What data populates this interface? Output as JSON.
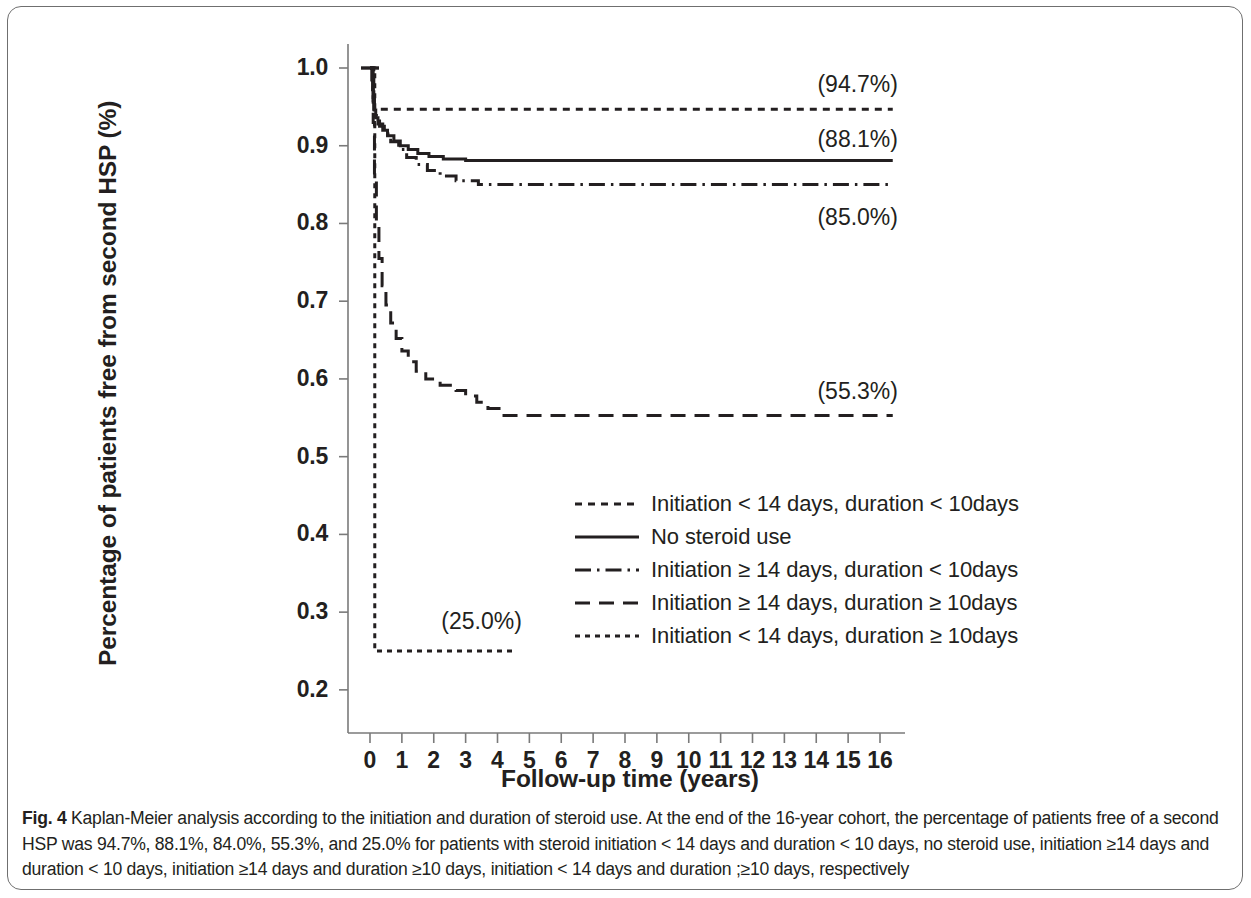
{
  "figure": {
    "number": "Fig. 4",
    "caption": "Kaplan-Meier analysis according to the initiation and duration of steroid use. At the end of the 16-year cohort, the percentage of patients free of a second HSP was 94.7%, 88.1%, 84.0%, 55.3%, and 25.0% for patients with steroid initiation < 14 days and duration < 10 days, no steroid use, initiation ≥14 days and duration < 10 days, initiation ≥14 days and duration ≥10 days, initiation < 14 days and duration ;≥10 days, respectively"
  },
  "chart_data": {
    "type": "line",
    "title": "",
    "subtitle": "",
    "xlabel": "Follow-up time (years)",
    "ylabel": "Percentage of patients free from second HSP (%)",
    "xlim": [
      0,
      16.6
    ],
    "ylim": [
      0.2,
      1.0
    ],
    "grid": false,
    "legend_position": "center-right-inside",
    "x_ticks": [
      "0",
      "1",
      "2",
      "3",
      "4",
      "5",
      "6",
      "7",
      "8",
      "9",
      "10",
      "11",
      "12",
      "13",
      "14",
      "15",
      "16"
    ],
    "x_tick_values": [
      0,
      1,
      2,
      3,
      4,
      5,
      6,
      7,
      8,
      9,
      10,
      11,
      12,
      13,
      14,
      15,
      16
    ],
    "y_ticks": [
      "0.2",
      "0.3",
      "0.4",
      "0.5",
      "0.6",
      "0.7",
      "0.8",
      "0.9",
      "1.0"
    ],
    "y_tick_values": [
      0.2,
      0.3,
      0.4,
      0.5,
      0.6,
      0.7,
      0.8,
      0.9,
      1.0
    ],
    "line_color": "#231f20",
    "series": [
      {
        "name": "Initiation < 14 days, duration < 10days",
        "dash": "dotted",
        "final_label": "(94.7%)",
        "final_value": 0.947,
        "points": [
          [
            0.0,
            1.0
          ],
          [
            0.12,
            1.0
          ],
          [
            0.12,
            0.947
          ],
          [
            16.4,
            0.947
          ]
        ]
      },
      {
        "name": "No steroid use",
        "dash": "solid",
        "final_label": "(88.1%)",
        "final_value": 0.881,
        "points": [
          [
            0.0,
            1.0
          ],
          [
            0.06,
            1.0
          ],
          [
            0.06,
            0.985
          ],
          [
            0.08,
            0.985
          ],
          [
            0.08,
            0.972
          ],
          [
            0.1,
            0.972
          ],
          [
            0.1,
            0.958
          ],
          [
            0.13,
            0.958
          ],
          [
            0.13,
            0.946
          ],
          [
            0.18,
            0.946
          ],
          [
            0.18,
            0.936
          ],
          [
            0.25,
            0.936
          ],
          [
            0.25,
            0.928
          ],
          [
            0.4,
            0.928
          ],
          [
            0.4,
            0.92
          ],
          [
            0.55,
            0.92
          ],
          [
            0.55,
            0.913
          ],
          [
            0.75,
            0.913
          ],
          [
            0.75,
            0.906
          ],
          [
            0.95,
            0.906
          ],
          [
            0.95,
            0.9
          ],
          [
            1.2,
            0.9
          ],
          [
            1.2,
            0.895
          ],
          [
            1.5,
            0.895
          ],
          [
            1.5,
            0.89
          ],
          [
            1.85,
            0.89
          ],
          [
            1.85,
            0.886
          ],
          [
            2.3,
            0.886
          ],
          [
            2.3,
            0.883
          ],
          [
            3.0,
            0.883
          ],
          [
            3.0,
            0.881
          ],
          [
            16.4,
            0.881
          ]
        ]
      },
      {
        "name": "Initiation ≥ 14 days, duration < 10days",
        "dash": "dashdot",
        "final_label": "(85.0%)",
        "final_value": 0.85,
        "points": [
          [
            0.0,
            1.0
          ],
          [
            0.07,
            1.0
          ],
          [
            0.07,
            0.98
          ],
          [
            0.1,
            0.98
          ],
          [
            0.1,
            0.962
          ],
          [
            0.14,
            0.962
          ],
          [
            0.14,
            0.948
          ],
          [
            0.2,
            0.948
          ],
          [
            0.2,
            0.936
          ],
          [
            0.3,
            0.936
          ],
          [
            0.3,
            0.925
          ],
          [
            0.45,
            0.925
          ],
          [
            0.45,
            0.915
          ],
          [
            0.65,
            0.915
          ],
          [
            0.65,
            0.905
          ],
          [
            0.9,
            0.905
          ],
          [
            0.9,
            0.895
          ],
          [
            1.15,
            0.895
          ],
          [
            1.15,
            0.885
          ],
          [
            1.45,
            0.885
          ],
          [
            1.45,
            0.876
          ],
          [
            1.8,
            0.876
          ],
          [
            1.8,
            0.868
          ],
          [
            2.2,
            0.868
          ],
          [
            2.2,
            0.861
          ],
          [
            2.7,
            0.861
          ],
          [
            2.7,
            0.855
          ],
          [
            3.4,
            0.855
          ],
          [
            3.4,
            0.85
          ],
          [
            16.4,
            0.85
          ]
        ]
      },
      {
        "name": "Initiation ≥ 14 days, duration ≥ 10days",
        "dash": "dashed",
        "final_label": "(55.3%)",
        "final_value": 0.553,
        "points": [
          [
            0.0,
            1.0
          ],
          [
            0.1,
            1.0
          ],
          [
            0.1,
            0.93
          ],
          [
            0.14,
            0.93
          ],
          [
            0.14,
            0.86
          ],
          [
            0.2,
            0.86
          ],
          [
            0.2,
            0.8
          ],
          [
            0.28,
            0.8
          ],
          [
            0.28,
            0.755
          ],
          [
            0.38,
            0.755
          ],
          [
            0.38,
            0.72
          ],
          [
            0.5,
            0.72
          ],
          [
            0.5,
            0.695
          ],
          [
            0.65,
            0.695
          ],
          [
            0.65,
            0.672
          ],
          [
            0.82,
            0.672
          ],
          [
            0.82,
            0.652
          ],
          [
            1.0,
            0.652
          ],
          [
            1.0,
            0.636
          ],
          [
            1.2,
            0.636
          ],
          [
            1.2,
            0.622
          ],
          [
            1.45,
            0.622
          ],
          [
            1.45,
            0.61
          ],
          [
            1.75,
            0.61
          ],
          [
            1.75,
            0.6
          ],
          [
            2.2,
            0.6
          ],
          [
            2.2,
            0.592
          ],
          [
            2.7,
            0.592
          ],
          [
            2.7,
            0.585
          ],
          [
            3.0,
            0.585
          ],
          [
            3.0,
            0.578
          ],
          [
            3.35,
            0.578
          ],
          [
            3.35,
            0.57
          ],
          [
            3.7,
            0.57
          ],
          [
            3.7,
            0.562
          ],
          [
            4.1,
            0.562
          ],
          [
            4.1,
            0.553
          ],
          [
            16.4,
            0.553
          ]
        ]
      },
      {
        "name": "Initiation < 14 days, duration ≥ 10days",
        "dash": "dotted-fine",
        "final_label": "(25.0%)",
        "final_value": 0.25,
        "points": [
          [
            0.0,
            1.0
          ],
          [
            0.15,
            1.0
          ],
          [
            0.15,
            0.25
          ],
          [
            4.55,
            0.25
          ]
        ]
      }
    ],
    "annotations": [
      {
        "text": "(94.7%)",
        "x": 14.1,
        "y": 0.975
      },
      {
        "text": "(88.1%)",
        "x": 14.1,
        "y": 0.905
      },
      {
        "text": "(85.0%)",
        "x": 14.1,
        "y": 0.805
      },
      {
        "text": "(55.3%)",
        "x": 14.1,
        "y": 0.58
      },
      {
        "text": "(25.0%)",
        "x": 2.3,
        "y": 0.285
      }
    ]
  },
  "legend": {
    "items": [
      {
        "label": "Initiation < 14 days, duration < 10days",
        "dash": "dotted"
      },
      {
        "label": "No steroid use",
        "dash": "solid"
      },
      {
        "label": "Initiation ≥ 14 days, duration < 10days",
        "dash": "dashdot"
      },
      {
        "label": "Initiation ≥ 14 days, duration ≥ 10days",
        "dash": "dashed"
      },
      {
        "label": "Initiation < 14 days, duration ≥ 10days",
        "dash": "dotted-fine"
      }
    ]
  }
}
